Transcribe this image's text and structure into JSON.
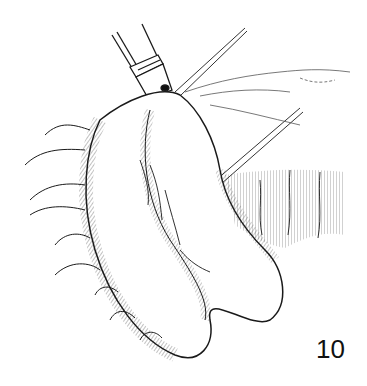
{
  "figure": {
    "label": "10",
    "ink_color": "#1a1a1a",
    "background": "#ffffff"
  }
}
